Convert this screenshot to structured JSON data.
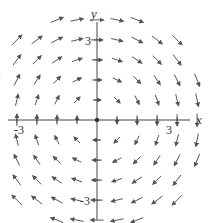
{
  "figure": {
    "type": "vector_field",
    "field": "F(x, y) = y i - x j",
    "axes": {
      "x_label": "x",
      "y_label": "y",
      "x_ticks": [
        {
          "value": -3,
          "label": "-3"
        },
        {
          "value": 3,
          "label": "3"
        }
      ],
      "y_ticks": [
        {
          "value": 3,
          "label": "3"
        },
        {
          "value": -3,
          "label": "-3"
        }
      ],
      "range": [
        -3.6,
        3.6
      ]
    },
    "grid_step": 0.75,
    "arrow_color": "#555555",
    "axis_color": "#444444"
  }
}
